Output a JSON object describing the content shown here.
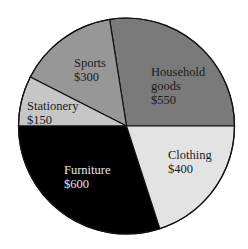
{
  "chart_data": {
    "type": "pie",
    "title": "",
    "unit": "$",
    "start_angle_deg": 0,
    "direction": "counterclockwise",
    "total": 2000,
    "slices": [
      {
        "label": "Household goods",
        "label_lines": [
          "Household",
          "goods",
          "$550"
        ],
        "value": 550,
        "color": "#7a7a7a",
        "text_color": "#1a1a1a"
      },
      {
        "label": "Sports",
        "label_lines": [
          "Sports",
          "$300"
        ],
        "value": 300,
        "color": "#979797",
        "text_color": "#1a1a1a"
      },
      {
        "label": "Stationery",
        "label_lines": [
          "Stationery",
          "$150"
        ],
        "value": 150,
        "color": "#c6c6c6",
        "text_color": "#1a1a1a"
      },
      {
        "label": "Furniture",
        "label_lines": [
          "Furniture",
          "$600"
        ],
        "value": 600,
        "color": "#000000",
        "text_color": "#e6e6e6"
      },
      {
        "label": "Clothing",
        "label_lines": [
          "Clothing",
          "$400"
        ],
        "value": 400,
        "color": "#e3e3e3",
        "text_color": "#1a1a1a"
      }
    ],
    "legend": null
  },
  "labels": {
    "household": {
      "line1": "Household",
      "line2": "goods",
      "line3": "$550"
    },
    "sports": {
      "line1": "Sports",
      "line2": "$300"
    },
    "stationery": {
      "line1": "Stationery",
      "line2": "$150"
    },
    "furniture": {
      "line1": "Furniture",
      "line2": "$600"
    },
    "clothing": {
      "line1": "Clothing",
      "line2": "$400"
    }
  },
  "geometry": {
    "cx": 126.5,
    "cy": 126,
    "r": 108
  }
}
